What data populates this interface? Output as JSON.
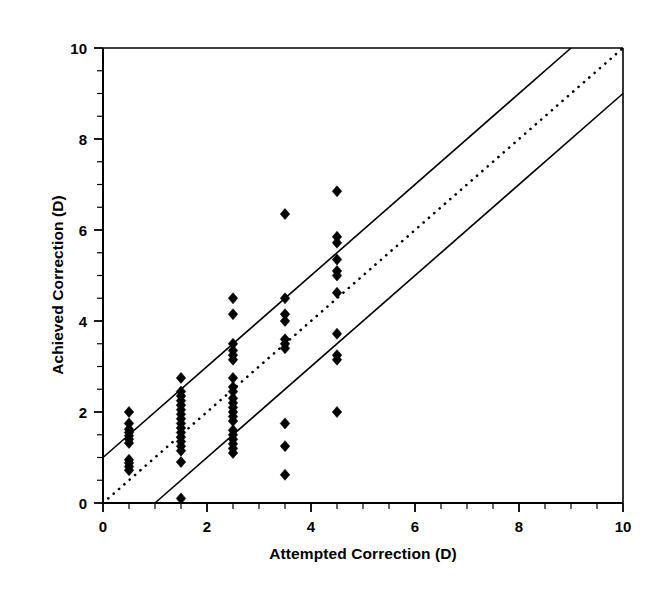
{
  "chart_data": {
    "type": "scatter",
    "title": "",
    "xlabel": "Attempted Correction (D)",
    "ylabel": "Achieved Correction (D)",
    "xlim": [
      0,
      10
    ],
    "ylim": [
      0,
      10
    ],
    "xticks": [
      0,
      2,
      4,
      6,
      8,
      10
    ],
    "yticks": [
      0,
      2,
      4,
      6,
      8,
      10
    ],
    "xtick_labels": [
      "0",
      "2",
      "4",
      "6",
      "8",
      "10"
    ],
    "ytick_labels": [
      "0",
      "2",
      "4",
      "6",
      "8",
      "10"
    ],
    "minor_tick_interval": 0.5,
    "grid": false,
    "legend": null,
    "marker": "diamond",
    "marker_color": "#000000",
    "marker_size": 9,
    "axis_color": "#000000",
    "background": "#ffffff",
    "series": [
      {
        "name": "Eyes",
        "marker": "diamond",
        "points": [
          [
            0.5,
            2.0
          ],
          [
            0.5,
            1.75
          ],
          [
            0.5,
            1.62
          ],
          [
            0.5,
            1.55
          ],
          [
            0.5,
            1.48
          ],
          [
            0.5,
            1.4
          ],
          [
            0.5,
            1.32
          ],
          [
            0.5,
            0.95
          ],
          [
            0.5,
            0.88
          ],
          [
            0.5,
            0.8
          ],
          [
            0.5,
            0.72
          ],
          [
            1.5,
            2.75
          ],
          [
            1.5,
            2.45
          ],
          [
            1.5,
            2.35
          ],
          [
            1.5,
            2.25
          ],
          [
            1.5,
            2.15
          ],
          [
            1.5,
            2.05
          ],
          [
            1.5,
            1.95
          ],
          [
            1.5,
            1.85
          ],
          [
            1.5,
            1.75
          ],
          [
            1.5,
            1.65
          ],
          [
            1.5,
            1.55
          ],
          [
            1.5,
            1.45
          ],
          [
            1.5,
            1.35
          ],
          [
            1.5,
            1.25
          ],
          [
            1.5,
            1.15
          ],
          [
            1.5,
            0.9
          ],
          [
            1.5,
            0.1
          ],
          [
            2.5,
            4.5
          ],
          [
            2.5,
            4.15
          ],
          [
            2.5,
            3.5
          ],
          [
            2.5,
            3.35
          ],
          [
            2.5,
            3.25
          ],
          [
            2.5,
            3.15
          ],
          [
            2.5,
            2.75
          ],
          [
            2.5,
            2.55
          ],
          [
            2.5,
            2.45
          ],
          [
            2.5,
            2.3
          ],
          [
            2.5,
            2.2
          ],
          [
            2.5,
            2.1
          ],
          [
            2.5,
            2.0
          ],
          [
            2.5,
            1.9
          ],
          [
            2.5,
            1.8
          ],
          [
            2.5,
            1.6
          ],
          [
            2.5,
            1.5
          ],
          [
            2.5,
            1.4
          ],
          [
            2.5,
            1.3
          ],
          [
            2.5,
            1.2
          ],
          [
            2.5,
            1.1
          ],
          [
            3.5,
            6.35
          ],
          [
            3.5,
            4.5
          ],
          [
            3.5,
            4.15
          ],
          [
            3.5,
            4.0
          ],
          [
            3.5,
            3.6
          ],
          [
            3.5,
            3.5
          ],
          [
            3.5,
            3.4
          ],
          [
            3.5,
            1.75
          ],
          [
            3.5,
            1.25
          ],
          [
            3.5,
            0.62
          ],
          [
            4.5,
            6.85
          ],
          [
            4.5,
            5.85
          ],
          [
            4.5,
            5.72
          ],
          [
            4.5,
            5.35
          ],
          [
            4.5,
            5.1
          ],
          [
            4.5,
            5.0
          ],
          [
            4.5,
            4.62
          ],
          [
            4.5,
            3.72
          ],
          [
            4.5,
            3.25
          ],
          [
            4.5,
            3.15
          ],
          [
            4.5,
            2.0
          ]
        ]
      }
    ],
    "reference_lines": [
      {
        "name": "identity-line",
        "style": "dotted",
        "slope": 1,
        "intercept": 0,
        "label": "y = x"
      },
      {
        "name": "upper-tolerance-line",
        "style": "solid",
        "slope": 1,
        "intercept": 1,
        "label": "y = x + 1"
      },
      {
        "name": "lower-tolerance-line",
        "style": "solid",
        "slope": 1,
        "intercept": -1,
        "label": "y = x - 1"
      }
    ]
  }
}
